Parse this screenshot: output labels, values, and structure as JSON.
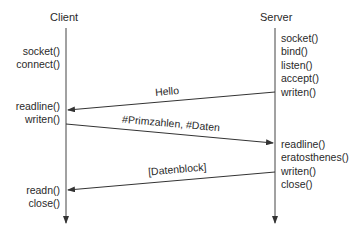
{
  "participants": {
    "client": {
      "label": "Client"
    },
    "server": {
      "label": "Server"
    }
  },
  "client_calls": {
    "group1": [
      "socket()",
      "connect()"
    ],
    "group2": [
      "readline()",
      "writen()"
    ],
    "group3": [
      "readn()",
      "close()"
    ]
  },
  "server_calls": {
    "group1": [
      "socket()",
      "bind()",
      "listen()",
      "accept()",
      "writen()"
    ],
    "group2": [
      "readline()",
      "eratosthenes()",
      "writen()",
      "close()"
    ]
  },
  "messages": [
    {
      "label": "Hello",
      "from": "Server",
      "to": "Client"
    },
    {
      "label": "#Primzahlen, #Daten",
      "from": "Client",
      "to": "Server"
    },
    {
      "label": "[Datenblock]",
      "from": "Server",
      "to": "Client"
    }
  ],
  "colors": {
    "line": "#333333",
    "text": "#2a2a2a"
  }
}
